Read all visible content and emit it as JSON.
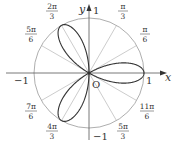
{
  "diagram": {
    "equation": "r = cos(3θ)",
    "axis_labels": {
      "x": "x",
      "y": "y",
      "origin": "O"
    },
    "ticks": {
      "x_pos": "1",
      "x_neg": "−1",
      "y_pos": "1",
      "y_neg": "−1"
    },
    "angle_labels": [
      {
        "num": "π",
        "den": "6",
        "angle_deg": 30
      },
      {
        "num": "π",
        "den": "3",
        "angle_deg": 60
      },
      {
        "num": "2π",
        "den": "3",
        "angle_deg": 120
      },
      {
        "num": "5π",
        "den": "6",
        "angle_deg": 150
      },
      {
        "num": "7π",
        "den": "6",
        "angle_deg": 210
      },
      {
        "num": "4π",
        "den": "3",
        "angle_deg": 240
      },
      {
        "num": "5π",
        "den": "3",
        "angle_deg": 300
      },
      {
        "num": "11π",
        "den": "6",
        "angle_deg": 330
      }
    ],
    "colors": {
      "curve": "#333333",
      "grid": "#999999",
      "axis": "#555555"
    }
  }
}
